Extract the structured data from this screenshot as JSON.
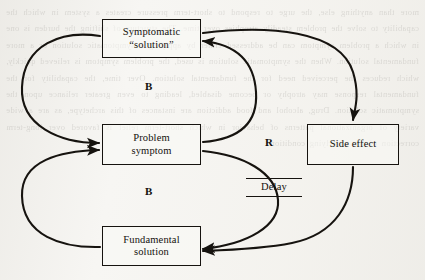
{
  "diagram": {
    "type": "causal-loop-diagram",
    "background_color": "#f7f6f3",
    "ink_color": "#16130f",
    "ghost_text": "more than anything else, the urge to respond to short-term pressure creates a system in which the capability to solve the problem steadily atrophies over time. The structure of shifting the burden is one in which a problem symptom can be addressed either by applying a symptomatic solution or a more fundamental solution. When the symptomatic solution is used, the problem symptom is relieved quickly, which reduces the perceived need for the fundamental solution. Over time, the capability for the fundamental response may atrophy or become disabled, leading to even greater reliance upon the symptomatic solution. Drug, alcohol and food addiction are instances of this archetype, as are a wide variety of organizational patterns of behavior in which short-term relief is favored over long-term correction of the underlying condition.",
    "nodes": [
      {
        "id": "symptomatic",
        "line1": "Symptomatic",
        "line2": "“solution”"
      },
      {
        "id": "problem",
        "line1": "Problem",
        "line2": "symptom"
      },
      {
        "id": "fundamental",
        "line1": "Fundamental",
        "line2": "solution"
      },
      {
        "id": "sideeffect",
        "line1": "Side effect",
        "line2": ""
      }
    ],
    "loop_labels": [
      {
        "id": "b-top",
        "label": "B",
        "meaning": "balancing-loop-symptomatic"
      },
      {
        "id": "b-bottom",
        "label": "B",
        "meaning": "balancing-loop-fundamental"
      },
      {
        "id": "r",
        "label": "R",
        "meaning": "reinforcing-loop-side-effect"
      }
    ],
    "delay": {
      "label": "Delay"
    },
    "links": [
      {
        "from": "symptomatic",
        "to": "problem",
        "side": "left"
      },
      {
        "from": "problem",
        "to": "symptomatic",
        "side": "right"
      },
      {
        "from": "fundamental",
        "to": "problem",
        "side": "left"
      },
      {
        "from": "problem",
        "to": "fundamental",
        "side": "right",
        "delay": true
      },
      {
        "from": "symptomatic",
        "to": "sideeffect",
        "side": "top-right"
      },
      {
        "from": "sideeffect",
        "to": "fundamental",
        "side": "bottom"
      }
    ]
  }
}
